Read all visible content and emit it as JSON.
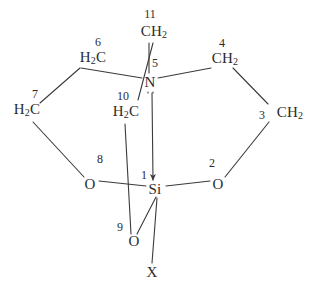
{
  "diagram": {
    "type": "chemical-structure",
    "stroke_color": "#3a3a3a",
    "text_color": "#2b2b2b",
    "background": "#ffffff",
    "atoms": [
      {
        "id": "si",
        "label": "Si",
        "sub": "",
        "x": 155,
        "y": 189
      },
      {
        "id": "n",
        "label": "N",
        "sub": "",
        "x": 150,
        "y": 82
      },
      {
        "id": "o2",
        "label": "O",
        "sub": "",
        "x": 218,
        "y": 184
      },
      {
        "id": "o8",
        "label": "O",
        "sub": "",
        "x": 90,
        "y": 184
      },
      {
        "id": "o9",
        "label": "O",
        "sub": "",
        "x": 134,
        "y": 241
      },
      {
        "id": "c3",
        "label": "CH",
        "sub": "2",
        "x": 290,
        "y": 113
      },
      {
        "id": "c4",
        "label": "CH",
        "sub": "2",
        "x": 225,
        "y": 59
      },
      {
        "id": "c6",
        "label": "H",
        "sub": "2",
        "x": 93,
        "y": 58,
        "label2": "C"
      },
      {
        "id": "c7",
        "label": "H",
        "sub": "2",
        "x": 27,
        "y": 110,
        "label2": "C"
      },
      {
        "id": "c10",
        "label": "H",
        "sub": "2",
        "x": 126,
        "y": 112,
        "label2": "C"
      },
      {
        "id": "c11",
        "label": "CH",
        "sub": "2",
        "x": 154,
        "y": 32
      },
      {
        "id": "x",
        "label": "X",
        "sub": "",
        "x": 152,
        "y": 272
      }
    ],
    "locants": [
      {
        "id": "locant-1",
        "text": "1",
        "x": 144,
        "y": 175
      },
      {
        "id": "locant-2",
        "text": "2",
        "x": 212,
        "y": 163
      },
      {
        "id": "locant-3",
        "text": "3",
        "x": 262,
        "y": 115
      },
      {
        "id": "locant-4",
        "text": "4",
        "x": 222,
        "y": 43
      },
      {
        "id": "locant-5",
        "text": "5",
        "x": 155,
        "y": 63
      },
      {
        "id": "locant-6",
        "text": "6",
        "x": 98,
        "y": 42
      },
      {
        "id": "locant-7",
        "text": "7",
        "x": 35,
        "y": 94
      },
      {
        "id": "locant-8",
        "text": "8",
        "x": 100,
        "y": 159
      },
      {
        "id": "locant-9",
        "text": "9",
        "x": 120,
        "y": 227
      },
      {
        "id": "locant-10",
        "text": "10",
        "x": 123,
        "y": 96
      },
      {
        "id": "locant-11",
        "text": "11",
        "x": 150,
        "y": 14
      }
    ],
    "bonds": [
      {
        "id": "bond-si-o8",
        "from": "Si",
        "to": "O8",
        "kind": "plain",
        "x1": 146,
        "y1": 186,
        "x2": 99,
        "y2": 181
      },
      {
        "id": "bond-si-o2",
        "from": "Si",
        "to": "O2",
        "kind": "plain",
        "x1": 166,
        "y1": 186,
        "x2": 210,
        "y2": 181
      },
      {
        "id": "bond-si-o9",
        "from": "Si",
        "to": "O9",
        "kind": "plain",
        "x1": 156,
        "y1": 197,
        "x2": 137,
        "y2": 234
      },
      {
        "id": "bond-si-x",
        "from": "Si",
        "to": "X",
        "kind": "plain",
        "x1": 157,
        "y1": 198,
        "x2": 152,
        "y2": 263
      },
      {
        "id": "bond-o8-c7",
        "from": "O8",
        "to": "C7",
        "kind": "plain",
        "x1": 84,
        "y1": 177,
        "x2": 33,
        "y2": 122
      },
      {
        "id": "bond-c7-c6",
        "from": "C7",
        "to": "C6",
        "kind": "plain",
        "x1": 40,
        "y1": 103,
        "x2": 80,
        "y2": 68
      },
      {
        "id": "bond-c6-n",
        "from": "C6",
        "to": "N",
        "kind": "plain",
        "x1": 81,
        "y1": 68,
        "x2": 142,
        "y2": 78
      },
      {
        "id": "bond-o2-c3",
        "from": "O2",
        "to": "C3",
        "kind": "plain",
        "x1": 225,
        "y1": 177,
        "x2": 269,
        "y2": 122
      },
      {
        "id": "bond-c3-c4",
        "from": "C3",
        "to": "C4",
        "kind": "plain",
        "x1": 268,
        "y1": 104,
        "x2": 233,
        "y2": 68
      },
      {
        "id": "bond-c4-n",
        "from": "C4",
        "to": "N",
        "kind": "plain",
        "x1": 211,
        "y1": 68,
        "x2": 158,
        "y2": 78
      },
      {
        "id": "bond-c11-n",
        "from": "C11",
        "to": "N",
        "kind": "plain",
        "x1": 149,
        "y1": 43,
        "x2": 149,
        "y2": 73
      },
      {
        "id": "bond-c11-c10",
        "from": "C11",
        "to": "C10",
        "kind": "plain",
        "x1": 153,
        "y1": 43,
        "x2": 138,
        "y2": 100
      },
      {
        "id": "bond-c10-o9",
        "from": "C10",
        "to": "O9",
        "kind": "plain",
        "x1": 125,
        "y1": 124,
        "x2": 131,
        "y2": 234
      },
      {
        "id": "bond-n-si",
        "from": "N",
        "to": "Si",
        "kind": "dative",
        "x1": 152,
        "y1": 93,
        "x2": 153,
        "y2": 180
      }
    ],
    "lone_pair": {
      "id": "nitrogen-lone-pair",
      "x": 151,
      "y": 93,
      "dots": 2
    }
  }
}
